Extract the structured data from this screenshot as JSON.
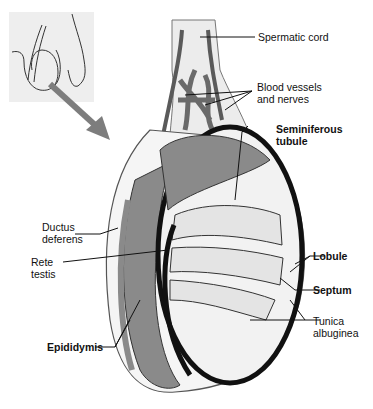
{
  "figure": {
    "inset": "Location of testis in body (line drawing)",
    "labels": {
      "spermatic_cord": "Spermatic cord",
      "blood_vessels": "Blood vessels\nand nerves",
      "seminiferous": "Seminiferous\ntubule",
      "ductus": "Ductus\ndeferens",
      "rete": "Rete\ntestis",
      "lobule": "Lobule",
      "septum": "Septum",
      "tunica": "Tunica\nalbuginea",
      "epididymis": "Epididymis"
    }
  },
  "colors": {
    "outline": "#111111",
    "tissue_gray": "#8a8a8a",
    "vessel_dark": "#5a5a5a",
    "pale_fill": "#ececec",
    "inset_bg": "#eeeeee",
    "arrow": "#7d7d7d"
  }
}
